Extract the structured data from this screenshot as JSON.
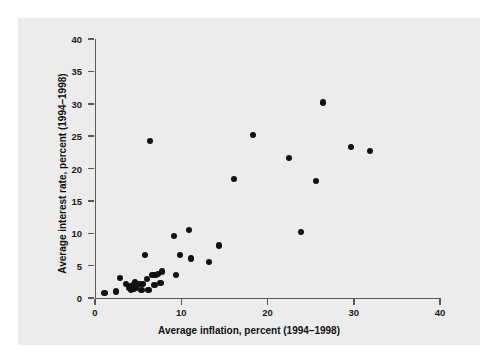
{
  "chart_data": {
    "type": "scatter",
    "title": "",
    "xlabel": "Average inflation, percent (1994–1998)",
    "ylabel": "Average interest rate, percent (1994–1998)",
    "xlim": [
      0,
      40
    ],
    "ylim": [
      0,
      40
    ],
    "xticks": [
      0,
      10,
      20,
      30,
      40
    ],
    "yticks": [
      0,
      5,
      10,
      15,
      20,
      25,
      30,
      35,
      40
    ],
    "xtick_labels": [
      "0",
      "10",
      "20",
      "30",
      "40"
    ],
    "ytick_labels": [
      "0",
      "5",
      "10",
      "15",
      "20",
      "25",
      "30",
      "35",
      "40"
    ],
    "grid": false,
    "legend": false,
    "marker": "filled-circle",
    "marker_color": "#111111",
    "panel_color": "#ececec",
    "axis_color": "#5a5a5a",
    "points": [
      {
        "x": 1.1,
        "y": 0.8
      },
      {
        "x": 2.4,
        "y": 1.0
      },
      {
        "x": 2.9,
        "y": 3.1
      },
      {
        "x": 3.6,
        "y": 2.2
      },
      {
        "x": 3.9,
        "y": 1.9
      },
      {
        "x": 4.0,
        "y": 1.6
      },
      {
        "x": 4.2,
        "y": 1.3
      },
      {
        "x": 4.4,
        "y": 2.0
      },
      {
        "x": 4.5,
        "y": 1.4
      },
      {
        "x": 4.6,
        "y": 2.4
      },
      {
        "x": 4.8,
        "y": 1.5
      },
      {
        "x": 5.0,
        "y": 2.2
      },
      {
        "x": 5.2,
        "y": 2.1
      },
      {
        "x": 5.4,
        "y": 1.2
      },
      {
        "x": 5.6,
        "y": 2.2
      },
      {
        "x": 5.8,
        "y": 6.6
      },
      {
        "x": 6.0,
        "y": 2.9
      },
      {
        "x": 6.2,
        "y": 1.2
      },
      {
        "x": 6.4,
        "y": 24.3
      },
      {
        "x": 6.6,
        "y": 3.5
      },
      {
        "x": 6.8,
        "y": 3.6
      },
      {
        "x": 6.9,
        "y": 2.0
      },
      {
        "x": 7.1,
        "y": 3.5
      },
      {
        "x": 7.3,
        "y": 3.7
      },
      {
        "x": 7.6,
        "y": 2.3
      },
      {
        "x": 7.8,
        "y": 4.1
      },
      {
        "x": 9.2,
        "y": 9.6
      },
      {
        "x": 9.4,
        "y": 3.6
      },
      {
        "x": 9.9,
        "y": 6.7
      },
      {
        "x": 10.9,
        "y": 10.5
      },
      {
        "x": 11.1,
        "y": 6.1
      },
      {
        "x": 13.2,
        "y": 5.6
      },
      {
        "x": 14.4,
        "y": 8.1
      },
      {
        "x": 16.1,
        "y": 18.4
      },
      {
        "x": 18.3,
        "y": 25.2
      },
      {
        "x": 22.5,
        "y": 21.6
      },
      {
        "x": 23.9,
        "y": 10.2
      },
      {
        "x": 25.6,
        "y": 18.1
      },
      {
        "x": 26.4,
        "y": 30.2
      },
      {
        "x": 29.7,
        "y": 23.3
      },
      {
        "x": 31.9,
        "y": 22.7
      }
    ]
  }
}
